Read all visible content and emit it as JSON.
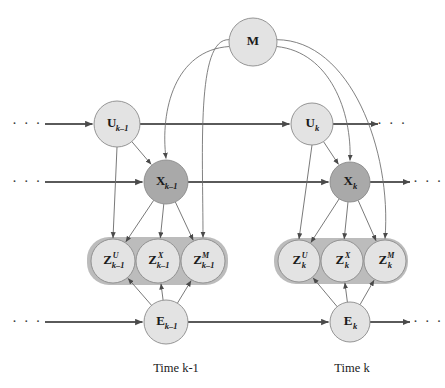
{
  "figure": {
    "type": "probabilistic-graphical-model",
    "title": "",
    "background_color": "#ffffff"
  },
  "palette": {
    "node_light": "#e3e3e3",
    "node_dark": "#a9a9a9",
    "node_stroke": "#8a8a8a",
    "plate_fill": "#bcbcbc",
    "edge_thick": "#5a5a5a",
    "edge_thin": "#6a6a6a",
    "text": "#1a1a1a"
  },
  "nodes": [
    {
      "id": "M",
      "main": "M",
      "sub": "",
      "sup": "",
      "cx": 253,
      "cy": 42,
      "r": 24,
      "shade": "light"
    },
    {
      "id": "Ukm1",
      "main": "U",
      "sub": "k–1",
      "sup": "",
      "cx": 117,
      "cy": 124,
      "r": 23,
      "shade": "light"
    },
    {
      "id": "Uk",
      "main": "U",
      "sub": "k",
      "sup": "",
      "cx": 312,
      "cy": 124,
      "r": 21,
      "shade": "light"
    },
    {
      "id": "Xkm1",
      "main": "X",
      "sub": "k–1",
      "sup": "",
      "cx": 166,
      "cy": 182,
      "r": 22,
      "shade": "dark"
    },
    {
      "id": "Xk",
      "main": "X",
      "sub": "k",
      "sup": "",
      "cx": 350,
      "cy": 182,
      "r": 20,
      "shade": "dark"
    },
    {
      "id": "ZUkm1",
      "main": "Z",
      "sub": "k–1",
      "sup": "U",
      "cx": 113,
      "cy": 261,
      "r": 22,
      "shade": "light"
    },
    {
      "id": "ZXkm1",
      "main": "Z",
      "sub": "k–1",
      "sup": "X",
      "cx": 158,
      "cy": 261,
      "r": 22,
      "shade": "light"
    },
    {
      "id": "ZMkm1",
      "main": "Z",
      "sub": "k–1",
      "sup": "M",
      "cx": 203,
      "cy": 261,
      "r": 22,
      "shade": "light"
    },
    {
      "id": "ZUk",
      "main": "Z",
      "sub": "k",
      "sup": "U",
      "cx": 299,
      "cy": 261,
      "r": 21,
      "shade": "light"
    },
    {
      "id": "ZXk",
      "main": "Z",
      "sub": "k",
      "sup": "X",
      "cx": 342,
      "cy": 261,
      "r": 21,
      "shade": "light"
    },
    {
      "id": "ZMk",
      "main": "Z",
      "sub": "k",
      "sup": "M",
      "cx": 385,
      "cy": 261,
      "r": 21,
      "shade": "light"
    },
    {
      "id": "Ekm1",
      "main": "E",
      "sub": "k–1",
      "sup": "",
      "cx": 166,
      "cy": 322,
      "r": 22,
      "shade": "light"
    },
    {
      "id": "Ek",
      "main": "E",
      "sub": "k",
      "sup": "",
      "cx": 350,
      "cy": 322,
      "r": 20,
      "shade": "light"
    }
  ],
  "plates": [
    {
      "id": "plate-km1",
      "x": 87,
      "y": 237,
      "width": 141,
      "height": 48,
      "rx": 22
    },
    {
      "id": "plate-k",
      "x": 274,
      "y": 238,
      "width": 134,
      "height": 46,
      "rx": 22
    }
  ],
  "captions": [
    {
      "id": "caption-time-km1",
      "text": "Time k-1",
      "x": 176,
      "y": 372
    },
    {
      "id": "caption-time-k",
      "text": "Time k",
      "x": 352,
      "y": 372
    }
  ],
  "ellipses": [
    {
      "id": "ellipsis-u-left",
      "text": "· · ·",
      "x": 27,
      "y": 128
    },
    {
      "id": "ellipsis-x-left",
      "text": "· · ·",
      "x": 27,
      "y": 186
    },
    {
      "id": "ellipsis-e-left",
      "text": "· · ·",
      "x": 27,
      "y": 326
    },
    {
      "id": "ellipsis-u-right",
      "text": "· · ·",
      "x": 392,
      "y": 128
    },
    {
      "id": "ellipsis-x-right",
      "text": "· · ·",
      "x": 428,
      "y": 186
    },
    {
      "id": "ellipsis-e-right",
      "text": "· · ·",
      "x": 428,
      "y": 326
    }
  ],
  "edges": {
    "chain_u": [
      {
        "id": "edge-u-in",
        "from": "...",
        "to": "Ukm1"
      },
      {
        "id": "edge-u-km1-k",
        "from": "Ukm1",
        "to": "Uk"
      },
      {
        "id": "edge-u-out",
        "from": "Uk",
        "to": "..."
      }
    ],
    "chain_x": [
      {
        "id": "edge-x-in",
        "from": "...",
        "to": "Xkm1"
      },
      {
        "id": "edge-x-km1-k",
        "from": "Xkm1",
        "to": "Xk"
      },
      {
        "id": "edge-x-out",
        "from": "Xk",
        "to": "..."
      }
    ],
    "chain_e": [
      {
        "id": "edge-e-in",
        "from": "...",
        "to": "Ekm1"
      },
      {
        "id": "edge-e-km1-k",
        "from": "Ekm1",
        "to": "Ek"
      },
      {
        "id": "edge-e-out",
        "from": "Ek",
        "to": "..."
      }
    ],
    "u_to_x": [
      {
        "id": "edge-ukm1-xkm1",
        "from": "Ukm1",
        "to": "Xkm1"
      },
      {
        "id": "edge-uk-xk",
        "from": "Uk",
        "to": "Xk"
      }
    ],
    "u_to_z": [
      {
        "id": "edge-ukm1-zukm1",
        "from": "Ukm1",
        "to": "ZUkm1"
      },
      {
        "id": "edge-uk-zuk",
        "from": "Uk",
        "to": "ZUk"
      }
    ],
    "m_to_x": [
      {
        "id": "edge-m-xkm1",
        "from": "M",
        "to": "Xkm1"
      },
      {
        "id": "edge-m-xk",
        "from": "M",
        "to": "Xk"
      }
    ],
    "m_to_z": [
      {
        "id": "edge-m-zmkm1",
        "from": "M",
        "to": "ZMkm1"
      },
      {
        "id": "edge-m-zmk",
        "from": "M",
        "to": "ZMk"
      }
    ],
    "x_to_z": [
      {
        "id": "edge-xkm1-zukm1",
        "from": "Xkm1",
        "to": "ZUkm1"
      },
      {
        "id": "edge-xkm1-zxkm1",
        "from": "Xkm1",
        "to": "ZXkm1"
      },
      {
        "id": "edge-xkm1-zmkm1",
        "from": "Xkm1",
        "to": "ZMkm1"
      },
      {
        "id": "edge-xk-zuk",
        "from": "Xk",
        "to": "ZUk"
      },
      {
        "id": "edge-xk-zxk",
        "from": "Xk",
        "to": "ZXk"
      },
      {
        "id": "edge-xk-zmk",
        "from": "Xk",
        "to": "ZMk"
      }
    ],
    "e_to_z": [
      {
        "id": "edge-ekm1-zukm1",
        "from": "Ekm1",
        "to": "ZUkm1"
      },
      {
        "id": "edge-ekm1-zxkm1",
        "from": "Ekm1",
        "to": "ZXkm1"
      },
      {
        "id": "edge-ekm1-zmkm1",
        "from": "Ekm1",
        "to": "ZMkm1"
      },
      {
        "id": "edge-ek-zuk",
        "from": "Ek",
        "to": "ZUk"
      },
      {
        "id": "edge-ek-zxk",
        "from": "Ek",
        "to": "ZXk"
      },
      {
        "id": "edge-ek-zmk",
        "from": "Ek",
        "to": "ZMk"
      }
    ]
  }
}
